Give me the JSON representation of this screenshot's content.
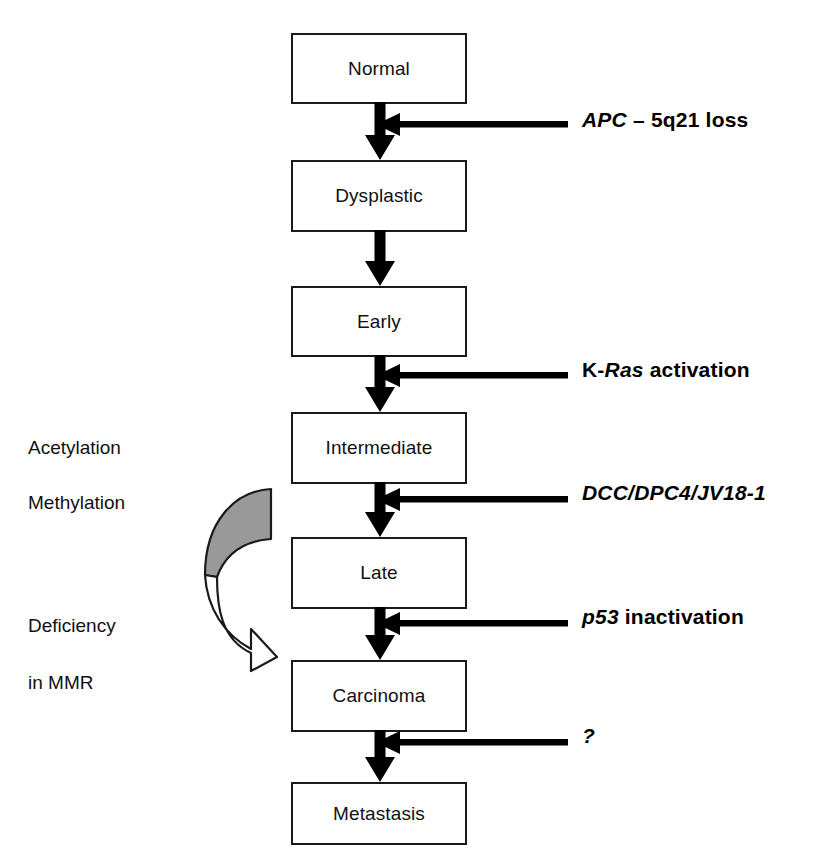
{
  "diagram": {
    "colors": {
      "outline": "#1a1a1a",
      "arrow_fill": "#000000",
      "curved_arrow_gray": "#999999",
      "background": "#ffffff",
      "text": "#111111"
    },
    "stages": [
      {
        "id": "normal",
        "label": "Normal",
        "x": 291,
        "y": 33,
        "w": 176,
        "h": 71
      },
      {
        "id": "dysplastic",
        "label": "Dysplastic",
        "x": 291,
        "y": 160,
        "w": 176,
        "h": 72
      },
      {
        "id": "early",
        "label": "Early",
        "x": 291,
        "y": 286,
        "w": 176,
        "h": 71
      },
      {
        "id": "intermediate",
        "label": "Intermediate",
        "x": 291,
        "y": 412,
        "w": 176,
        "h": 72
      },
      {
        "id": "late",
        "label": "Late",
        "x": 291,
        "y": 537,
        "w": 176,
        "h": 72
      },
      {
        "id": "carcinoma",
        "label": "Carcinoma",
        "x": 291,
        "y": 660,
        "w": 176,
        "h": 72
      },
      {
        "id": "metastasis",
        "label": "Metastasis",
        "x": 291,
        "y": 782,
        "w": 176,
        "h": 63
      }
    ],
    "transitions": [
      {
        "id": "normal-to-dysplastic",
        "from": "normal",
        "to": "dysplastic",
        "top": 104,
        "bottom": 160
      },
      {
        "id": "dysplastic-to-early",
        "from": "dysplastic",
        "to": "early",
        "top": 232,
        "bottom": 286
      },
      {
        "id": "early-to-intermediate",
        "from": "early",
        "to": "intermediate",
        "top": 357,
        "bottom": 412
      },
      {
        "id": "intermediate-to-late",
        "from": "intermediate",
        "to": "late",
        "top": 484,
        "bottom": 537
      },
      {
        "id": "late-to-carcinoma",
        "from": "late",
        "to": "carcinoma",
        "top": 609,
        "bottom": 660
      },
      {
        "id": "carcinoma-to-metastasis",
        "from": "carcinoma",
        "to": "metastasis",
        "top": 732,
        "bottom": 782
      }
    ],
    "genetic_events": [
      {
        "id": "apc",
        "transition": "normal-to-dysplastic",
        "gene": "APC",
        "rest": " – 5q21 loss",
        "full_text": "APC – 5q21 loss",
        "gene_italic": true,
        "prefix": "",
        "label_x": 582,
        "label_y": 108,
        "line_y": 124,
        "line_x_start": 398,
        "line_x_end": 566
      },
      {
        "id": "kras",
        "transition": "early-to-intermediate",
        "gene": "Ras",
        "rest": " activation",
        "full_text": "K-Ras activation",
        "gene_italic": true,
        "prefix": "K-",
        "label_x": 582,
        "label_y": 358,
        "line_y": 375,
        "line_x_start": 398,
        "line_x_end": 566
      },
      {
        "id": "dcc",
        "transition": "intermediate-to-late",
        "gene": "DCC/DPC4/JV18-1",
        "rest": "",
        "full_text": "DCC/DPC4/JV18-1",
        "gene_italic": true,
        "prefix": "",
        "label_x": 582,
        "label_y": 481,
        "line_y": 499,
        "line_x_start": 398,
        "line_x_end": 566
      },
      {
        "id": "p53",
        "transition": "late-to-carcinoma",
        "gene": "p53",
        "rest": " inactivation",
        "full_text": "p53 inactivation",
        "gene_italic": true,
        "prefix": "",
        "label_x": 582,
        "label_y": 605,
        "line_y": 623,
        "line_x_start": 398,
        "line_x_end": 566
      },
      {
        "id": "unknown",
        "transition": "carcinoma-to-metastasis",
        "gene": "?",
        "rest": "",
        "full_text": "?",
        "gene_italic": true,
        "prefix": "",
        "label_x": 582,
        "label_y": 724,
        "line_y": 742,
        "line_x_start": 398,
        "line_x_end": 566
      }
    ],
    "epigenetic_notes": [
      {
        "id": "acetylation",
        "label": "Acetylation",
        "x": 28,
        "y": 437
      },
      {
        "id": "methylation",
        "label": "Methylation",
        "x": 28,
        "y": 492
      },
      {
        "id": "deficiency",
        "label": "Deficiency",
        "x": 28,
        "y": 615
      },
      {
        "id": "in-mmr",
        "label": "in MMR",
        "x": 28,
        "y": 672
      }
    ],
    "curved_arrow": {
      "id": "epigenetic-curved-arrow",
      "description": "curved two-tone arrow from upper-left sweeping down to Carcinoma",
      "gray_fill": "#999999",
      "white_fill": "#ffffff",
      "stroke": "#1a1a1a"
    }
  }
}
